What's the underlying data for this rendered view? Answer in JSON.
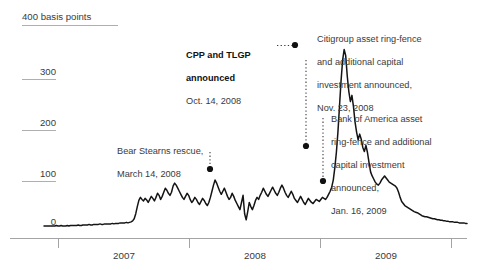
{
  "chart_data": {
    "type": "line",
    "title": "",
    "subtitle": "",
    "xlabel": "",
    "ylabel": "400 basis points",
    "unit": "basis points",
    "grid": true,
    "legend": "none",
    "ylim": [
      0,
      400
    ],
    "yticks": [
      0,
      100,
      200,
      300,
      400
    ],
    "ytick_labels": [
      "0",
      "100",
      "200",
      "300",
      "400 basis points"
    ],
    "xlim": [
      "2006-07",
      "2009-10"
    ],
    "xticks": [
      "2006-07-01",
      "2007-01-01",
      "2008-01-01",
      "2009-01-01",
      "2009-10-01"
    ],
    "xtick_labels": [
      "2007",
      "2008",
      "2009"
    ],
    "series": [
      {
        "name": "Credit spread",
        "values": [
          6,
          6,
          6,
          6,
          6,
          6,
          6,
          6,
          7,
          6,
          6,
          7,
          6,
          6,
          6,
          7,
          6,
          7,
          7,
          7,
          7,
          7,
          8,
          7,
          7,
          8,
          8,
          8,
          8,
          9,
          8,
          8,
          9,
          9,
          9,
          9,
          10,
          9,
          9,
          10,
          10,
          10,
          10,
          10,
          11,
          10,
          11,
          11,
          11,
          12,
          12,
          12,
          12,
          13,
          12,
          13,
          14,
          16,
          20,
          30,
          44,
          56,
          62,
          58,
          55,
          60,
          57,
          52,
          58,
          64,
          60,
          55,
          62,
          70,
          66,
          58,
          64,
          72,
          80,
          76,
          70,
          66,
          72,
          84,
          90,
          86,
          80,
          74,
          68,
          62,
          58,
          64,
          70,
          66,
          58,
          52,
          56,
          62,
          58,
          52,
          48,
          54,
          60,
          56,
          50,
          46,
          52,
          62,
          74,
          86,
          96,
          90,
          82,
          74,
          68,
          74,
          80,
          72,
          64,
          58,
          62,
          70,
          64,
          56,
          50,
          44,
          38,
          52,
          66,
          30,
          18,
          34,
          52,
          44,
          38,
          46,
          56,
          62,
          58,
          66,
          72,
          80,
          74,
          68,
          64,
          70,
          76,
          82,
          76,
          70,
          66,
          72,
          80,
          86,
          80,
          72,
          66,
          62,
          68,
          74,
          68,
          60,
          56,
          52,
          58,
          64,
          58,
          52,
          48,
          54,
          60,
          56,
          52,
          50,
          54,
          58,
          56,
          54,
          58,
          62,
          60,
          58,
          62,
          68,
          74,
          82,
          96,
          120,
          150,
          190,
          240,
          290,
          330,
          352,
          340,
          300,
          270,
          250,
          262,
          240,
          210,
          190,
          175,
          186,
          176,
          160,
          152,
          164,
          150,
          130,
          112,
          104,
          98,
          92,
          88,
          86,
          90,
          96,
          100,
          104,
          100,
          96,
          92,
          90,
          88,
          86,
          84,
          80,
          72,
          62,
          54,
          50,
          46,
          44,
          42,
          40,
          38,
          36,
          34,
          33,
          32,
          30,
          28,
          26,
          25,
          24,
          24,
          23,
          22,
          21,
          20,
          20,
          19,
          18,
          18,
          17,
          17,
          16,
          16,
          15,
          15,
          14,
          14,
          14,
          13,
          13,
          13,
          12,
          12,
          12,
          12,
          11,
          11
        ]
      }
    ],
    "annotations": [
      {
        "id": "bear-stearns",
        "heading": "",
        "text": "Bear Stearns rescue,\nMarch 14, 2008",
        "date": "March 14, 2008",
        "value": 75
      },
      {
        "id": "cpp-tlgp",
        "heading": "CPP and TLGP\nannounced",
        "text": "Oct. 14, 2008",
        "date": "Oct. 14, 2008",
        "value": 352
      },
      {
        "id": "citigroup",
        "heading": "",
        "text": "Citigroup asset ring-fence\nand additional capital\ninvestment announced,\nNov. 23, 2008",
        "date": "Nov. 23, 2008",
        "value": 160
      },
      {
        "id": "bank-of-america",
        "heading": "",
        "text": "Bank of America asset\nring-fence and additional\ncapital investment\nannounced,\nJan. 16, 2009",
        "date": "Jan. 16, 2009",
        "value": 90
      }
    ],
    "colors": {
      "line": "#141414",
      "axis": "#8c8c8c",
      "text": "#3a3a3a",
      "background": "#ffffff",
      "marker": "#111111"
    }
  },
  "yaxis": {
    "t400": "400 basis points",
    "t300": "300",
    "t200": "200",
    "t100": "100",
    "t0": "0"
  },
  "xaxis": {
    "y2007": "2007",
    "y2008": "2008",
    "y2009": "2009"
  },
  "annotations": {
    "bear": {
      "line1": "Bear Stearns rescue,",
      "line2": "March 14, 2008"
    },
    "cpp": {
      "line1": "CPP and TLGP",
      "line2": "announced",
      "line3": "Oct. 14, 2008"
    },
    "citi": {
      "line1": "Citigroup asset ring-fence",
      "line2": "and additional capital",
      "line3": "investment announced,",
      "line4": "Nov. 23, 2008"
    },
    "bofa": {
      "line1": "Bank of America asset",
      "line2": "ring-fence and additional",
      "line3": "capital investment",
      "line4": "announced,",
      "line5": "Jan. 16, 2009"
    }
  }
}
